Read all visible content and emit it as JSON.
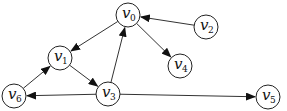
{
  "diagram": {
    "type": "directed-graph",
    "nodes": [
      {
        "id": "v0",
        "label": "v",
        "sub": "0",
        "x": 128,
        "y": 15
      },
      {
        "id": "v1",
        "label": "v",
        "sub": "1",
        "x": 60,
        "y": 58
      },
      {
        "id": "v2",
        "label": "v",
        "sub": "2",
        "x": 206,
        "y": 27
      },
      {
        "id": "v3",
        "label": "v",
        "sub": "3",
        "x": 108,
        "y": 94
      },
      {
        "id": "v4",
        "label": "v",
        "sub": "4",
        "x": 180,
        "y": 66
      },
      {
        "id": "v5",
        "label": "v",
        "sub": "5",
        "x": 268,
        "y": 97
      },
      {
        "id": "v6",
        "label": "v",
        "sub": "6",
        "x": 14,
        "y": 96
      }
    ],
    "edges": [
      {
        "from": "v0",
        "to": "v1"
      },
      {
        "from": "v2",
        "to": "v0"
      },
      {
        "from": "v0",
        "to": "v4"
      },
      {
        "from": "v1",
        "to": "v3"
      },
      {
        "from": "v3",
        "to": "v0"
      },
      {
        "from": "v6",
        "to": "v1"
      },
      {
        "from": "v3",
        "to": "v6"
      },
      {
        "from": "v3",
        "to": "v5"
      }
    ],
    "node_radius": 12,
    "colors": {
      "stroke": "#222222",
      "fill": "#ffffff",
      "arrow": "#111111"
    }
  }
}
